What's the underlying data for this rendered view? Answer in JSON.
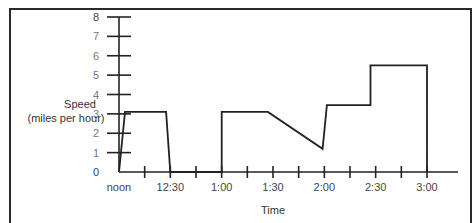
{
  "chart_data": {
    "type": "line",
    "title": "",
    "xlabel": "Time",
    "ylabel": "Speed\n(miles per hour)",
    "ylabel_lines": [
      "Speed",
      "(miles per hour)"
    ],
    "y_ticks": [
      "0",
      "1",
      "2",
      "3",
      "4",
      "5",
      "6",
      "7",
      "8"
    ],
    "x_tick_labels": [
      "noon",
      "12:30",
      "1:00",
      "1:30",
      "2:00",
      "2:30",
      "3:00"
    ],
    "x_unit": "minutes after noon",
    "xlim": [
      0,
      180
    ],
    "ylim": [
      0,
      8
    ],
    "grid": false,
    "legend": null,
    "series": [
      {
        "name": "Speed",
        "points": [
          {
            "t": 0,
            "v": 0
          },
          {
            "t": 3.5,
            "v": 3.1
          },
          {
            "t": 27.5,
            "v": 3.1
          },
          {
            "t": 30,
            "v": 0
          },
          {
            "t": 60,
            "v": 0
          },
          {
            "t": 60,
            "v": 3.1
          },
          {
            "t": 87,
            "v": 3.1
          },
          {
            "t": 119,
            "v": 1.2
          },
          {
            "t": 121.5,
            "v": 3.45
          },
          {
            "t": 147,
            "v": 3.45
          },
          {
            "t": 147,
            "v": 5.5
          },
          {
            "t": 180,
            "v": 5.5
          },
          {
            "t": 180,
            "v": 0
          }
        ]
      }
    ]
  }
}
